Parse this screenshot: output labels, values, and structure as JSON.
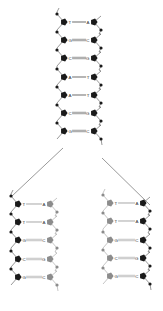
{
  "diagram": {
    "colors": {
      "old_strand": "#1a1a1a",
      "new_strand": "#8c8c8c",
      "backbone": "#333333",
      "bond": "#555555",
      "new_bond": "#9a9a9a",
      "background": "#ffffff"
    },
    "parent": {
      "left_x": 64,
      "right_x": 94,
      "left_phos_x": 57,
      "right_phos_x": 101,
      "pairs": [
        {
          "left": "T",
          "bond": "double",
          "right": "A",
          "y": 22
        },
        {
          "left": "G",
          "bond": "triple",
          "right": "C",
          "y": 40
        },
        {
          "left": "C",
          "bond": "triple",
          "right": "G",
          "y": 58
        },
        {
          "left": "A",
          "bond": "double",
          "right": "T",
          "y": 77
        },
        {
          "left": "A",
          "bond": "double",
          "right": "T",
          "y": 95
        },
        {
          "left": "C",
          "bond": "triple",
          "right": "G",
          "y": 113
        },
        {
          "left": "G",
          "bond": "triple",
          "right": "C",
          "y": 131
        }
      ]
    },
    "fork": {
      "left_line": {
        "x1": 63,
        "y1": 148,
        "x2": 12,
        "y2": 196
      },
      "right_line": {
        "x1": 102,
        "y1": 158,
        "x2": 150,
        "y2": 205
      }
    },
    "daughter_left": {
      "left_x": 18,
      "right_x": 50,
      "left_phos_x": 11,
      "right_phos_x": 57,
      "old_side": "left",
      "pairs": [
        {
          "left": "T",
          "bond": "double",
          "right": "A",
          "y": 204
        },
        {
          "left": "T",
          "bond": "double",
          "right": "A",
          "y": 222
        },
        {
          "left": "G",
          "bond": "triple",
          "right": "C",
          "y": 240
        },
        {
          "left": "C",
          "bond": "triple",
          "right": "G",
          "y": 259
        },
        {
          "left": "G",
          "bond": "triple",
          "right": "C",
          "y": 277
        }
      ]
    },
    "daughter_right": {
      "left_x": 110,
      "right_x": 143,
      "left_phos_x": 103,
      "right_phos_x": 150,
      "old_side": "right",
      "pairs": [
        {
          "left": "T",
          "bond": "double",
          "right": "A",
          "y": 203
        },
        {
          "left": "T",
          "bond": "double",
          "right": "A",
          "y": 221
        },
        {
          "left": "G",
          "bond": "triple",
          "right": "C",
          "y": 240
        },
        {
          "left": "C",
          "bond": "triple",
          "right": "G",
          "y": 258
        },
        {
          "left": "G",
          "bond": "triple",
          "right": "C",
          "y": 276
        }
      ]
    }
  }
}
